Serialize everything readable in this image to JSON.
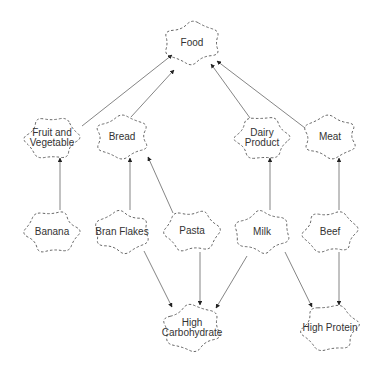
{
  "diagram": {
    "type": "directed-graph",
    "colors": {
      "node_stroke": "#555555",
      "edge": "#777777",
      "arrowhead": "#222222",
      "text": "#333333"
    },
    "nodes": [
      {
        "id": "food",
        "label": "Food",
        "x": 192,
        "y": 43,
        "rx": 32,
        "ry": 24
      },
      {
        "id": "fruitveg",
        "label": "Fruit and\nVegetable",
        "x": 52,
        "y": 138,
        "rx": 31,
        "ry": 24
      },
      {
        "id": "bread",
        "label": "Bread",
        "x": 122,
        "y": 137,
        "rx": 31,
        "ry": 24
      },
      {
        "id": "dairy",
        "label": "Dairy\nProduct",
        "x": 262,
        "y": 138,
        "rx": 31,
        "ry": 24
      },
      {
        "id": "meat",
        "label": "Meat",
        "x": 330,
        "y": 137,
        "rx": 31,
        "ry": 24
      },
      {
        "id": "banana",
        "label": "Banana",
        "x": 52,
        "y": 232,
        "rx": 31,
        "ry": 24
      },
      {
        "id": "branflakes",
        "label": "Bran Flakes",
        "x": 122,
        "y": 232,
        "rx": 31,
        "ry": 24
      },
      {
        "id": "pasta",
        "label": "Pasta",
        "x": 192,
        "y": 231,
        "rx": 31,
        "ry": 24
      },
      {
        "id": "milk",
        "label": "Milk",
        "x": 262,
        "y": 232,
        "rx": 31,
        "ry": 24
      },
      {
        "id": "beef",
        "label": "Beef",
        "x": 330,
        "y": 232,
        "rx": 31,
        "ry": 24
      },
      {
        "id": "highcarb",
        "label": "High\nCarbohydrate",
        "x": 192,
        "y": 328,
        "rx": 33,
        "ry": 26
      },
      {
        "id": "highprot",
        "label": "High Protein",
        "x": 330,
        "y": 328,
        "rx": 33,
        "ry": 26
      }
    ],
    "edges": [
      {
        "from": "fruitveg",
        "to": "food",
        "x1": 82,
        "y1": 126,
        "x2": 172,
        "y2": 55
      },
      {
        "from": "bread",
        "to": "food",
        "x1": 131,
        "y1": 117,
        "x2": 174,
        "y2": 70
      },
      {
        "from": "dairy",
        "to": "food",
        "x1": 250,
        "y1": 118,
        "x2": 211,
        "y2": 64
      },
      {
        "from": "meat",
        "to": "food",
        "x1": 305,
        "y1": 128,
        "x2": 217,
        "y2": 61
      },
      {
        "from": "banana",
        "to": "fruitveg",
        "x1": 60,
        "y1": 210,
        "x2": 60,
        "y2": 158
      },
      {
        "from": "branflakes",
        "to": "bread",
        "x1": 130,
        "y1": 210,
        "x2": 130,
        "y2": 158
      },
      {
        "from": "pasta",
        "to": "bread",
        "x1": 173,
        "y1": 213,
        "x2": 148,
        "y2": 157
      },
      {
        "from": "milk",
        "to": "dairy",
        "x1": 270,
        "y1": 210,
        "x2": 270,
        "y2": 158
      },
      {
        "from": "beef",
        "to": "meat",
        "x1": 339,
        "y1": 210,
        "x2": 339,
        "y2": 158
      },
      {
        "from": "branflakes",
        "to": "highcarb",
        "x1": 144,
        "y1": 251,
        "x2": 172,
        "y2": 307
      },
      {
        "from": "pasta",
        "to": "highcarb",
        "x1": 200,
        "y1": 252,
        "x2": 200,
        "y2": 305
      },
      {
        "from": "milk",
        "to": "highcarb",
        "x1": 247,
        "y1": 256,
        "x2": 216,
        "y2": 308
      },
      {
        "from": "milk",
        "to": "highprot",
        "x1": 285,
        "y1": 252,
        "x2": 312,
        "y2": 307
      },
      {
        "from": "beef",
        "to": "highprot",
        "x1": 339,
        "y1": 252,
        "x2": 339,
        "y2": 305
      }
    ]
  }
}
